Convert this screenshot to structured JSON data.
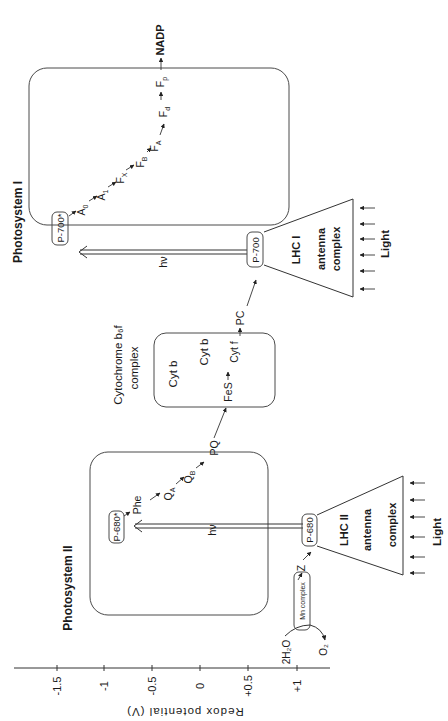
{
  "axis": {
    "label": "Redox potential (V)",
    "ticks": [
      {
        "label": "-1.5",
        "x": 57
      },
      {
        "label": "-1",
        "x": 104
      },
      {
        "label": "-0.5",
        "x": 152
      },
      {
        "label": "0",
        "x": 200
      },
      {
        "label": "+0.5",
        "x": 248
      },
      {
        "label": "+1",
        "x": 297
      }
    ]
  },
  "photosystem2": {
    "title": "Photosystem II",
    "p680_excited": "P-680*",
    "p680": "P-680",
    "phe": "Phe",
    "qa": "Q",
    "qa_sub": "A",
    "qb": "Q",
    "qb_sub": "B",
    "hv": "hν",
    "lhc": "LHC II",
    "antenna": "antenna",
    "complex": "complex",
    "light": "Light",
    "z": "Z",
    "mn_complex": "Mn complex",
    "water": "2H₂O",
    "oxygen": "O₂"
  },
  "cytochrome": {
    "title_line1": "Cytochrome b₆f",
    "title_line2": "complex",
    "pq": "PQ",
    "cyt_b1": "Cyt b",
    "cyt_b2": "Cyt b",
    "fes": "FeS",
    "cytf": "Cyt f",
    "pc": "PC"
  },
  "photosystem1": {
    "title": "Photosystem I",
    "p700_excited": "P-700*",
    "p700": "P-700",
    "a0": "A",
    "a0_sub": "0",
    "a1": "A",
    "a1_sub": "1",
    "fx": "F",
    "fx_sub": "X",
    "fb": "F",
    "fb_sub": "B",
    "fa": "F",
    "fa_sub": "A",
    "fd": "F",
    "fd_sub": "d",
    "fp": "F",
    "fp_sub": "p",
    "nadp": "NADP",
    "hv": "hν",
    "lhc": "LHC I",
    "antenna": "antenna",
    "complex": "complex",
    "light": "Light"
  }
}
